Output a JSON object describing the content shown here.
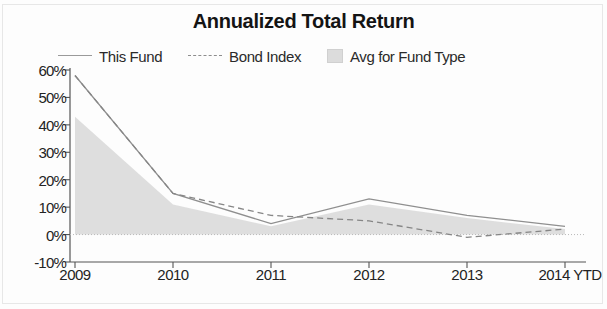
{
  "chart_data": {
    "type": "line",
    "title": "Annualized Total Return",
    "xlabel": "",
    "ylabel": "",
    "categories": [
      "2009",
      "2010",
      "2011",
      "2012",
      "2013",
      "2014 YTD"
    ],
    "ylim": [
      -10,
      60
    ],
    "ytick_labels": [
      "60%",
      "50%",
      "40%",
      "30%",
      "20%",
      "10%",
      "0%",
      "-10%"
    ],
    "ytick_values": [
      60,
      50,
      40,
      30,
      20,
      10,
      0,
      -10
    ],
    "grid": false,
    "zero_line": true,
    "legend_position": "top",
    "series": [
      {
        "name": "This Fund",
        "style": "solid-line",
        "color": "#8f8f8f",
        "values": [
          58,
          15,
          4,
          13,
          7,
          3
        ]
      },
      {
        "name": "Bond Index",
        "style": "dashed-line",
        "color": "#868686",
        "values": [
          58,
          15,
          7,
          5,
          -1,
          2
        ]
      },
      {
        "name": "Avg for Fund Type",
        "style": "filled-area",
        "color": "#dcdcdc",
        "values": [
          43,
          11,
          3,
          11,
          6,
          2
        ]
      }
    ]
  },
  "colors": {
    "this_fund": "#8f8f8f",
    "bond_index": "#868686",
    "avg_fund_type": "#dcdcdc",
    "axis": "#555555",
    "text": "#232323"
  }
}
